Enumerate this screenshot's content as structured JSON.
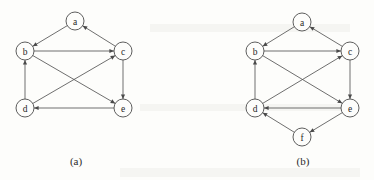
{
  "figure": {
    "background_color": "#fdfdfb",
    "ink_color": "#4c4c4c",
    "node_radius": 9,
    "panels": [
      {
        "id": "panel-a",
        "caption": "(a)",
        "caption_x": 76,
        "caption_y": 161,
        "nodes": [
          {
            "id": "a",
            "label": "a",
            "x": 75,
            "y": 21
          },
          {
            "id": "b",
            "label": "b",
            "x": 25,
            "y": 51
          },
          {
            "id": "c",
            "label": "c",
            "x": 123,
            "y": 51
          },
          {
            "id": "d",
            "label": "d",
            "x": 25,
            "y": 108
          },
          {
            "id": "e",
            "label": "e",
            "x": 123,
            "y": 108
          }
        ],
        "edges": [
          {
            "from": "a",
            "to": "b",
            "directed": true
          },
          {
            "from": "c",
            "to": "a",
            "directed": true
          },
          {
            "from": "b",
            "to": "c",
            "directed": true
          },
          {
            "from": "d",
            "to": "b",
            "directed": true
          },
          {
            "from": "c",
            "to": "e",
            "directed": true
          },
          {
            "from": "b",
            "to": "e",
            "directed": true
          },
          {
            "from": "d",
            "to": "c",
            "directed": true
          },
          {
            "from": "e",
            "to": "d",
            "directed": true
          }
        ]
      },
      {
        "id": "panel-b",
        "caption": "(b)",
        "caption_x": 303,
        "caption_y": 161,
        "nodes": [
          {
            "id": "a",
            "label": "a",
            "x": 302,
            "y": 22
          },
          {
            "id": "b",
            "label": "b",
            "x": 255,
            "y": 51
          },
          {
            "id": "c",
            "label": "c",
            "x": 350,
            "y": 51
          },
          {
            "id": "d",
            "label": "d",
            "x": 255,
            "y": 108
          },
          {
            "id": "e",
            "label": "e",
            "x": 350,
            "y": 108
          },
          {
            "id": "f",
            "label": "f",
            "x": 302,
            "y": 137
          }
        ],
        "edges": [
          {
            "from": "a",
            "to": "b",
            "directed": true
          },
          {
            "from": "c",
            "to": "a",
            "directed": true
          },
          {
            "from": "b",
            "to": "c",
            "directed": true
          },
          {
            "from": "d",
            "to": "b",
            "directed": true
          },
          {
            "from": "c",
            "to": "e",
            "directed": true
          },
          {
            "from": "b",
            "to": "e",
            "directed": true
          },
          {
            "from": "d",
            "to": "c",
            "directed": true
          },
          {
            "from": "e",
            "to": "d",
            "directed": true
          },
          {
            "from": "e",
            "to": "f",
            "directed": true
          },
          {
            "from": "f",
            "to": "d",
            "directed": true
          }
        ]
      }
    ]
  }
}
